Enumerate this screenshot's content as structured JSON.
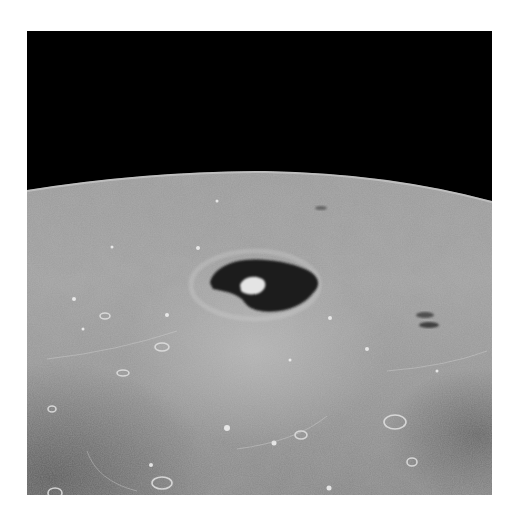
{
  "image": {
    "subject": "Lunar surface photographed from orbit with curved horizon and dark-floored crater",
    "alt": "Far side of the Moon from orbit showing a large crater with a dark mare floor and bright central peak",
    "colors": {
      "page_background": "#ffffff",
      "space": "#000000",
      "surface_light": "#a8a8a8",
      "surface_mid": "#8a8a8a",
      "surface_dark": "#5e5e5e",
      "crater_floor": "#1e1e1e",
      "central_peak": "#e8e8e8"
    },
    "features": [
      {
        "name": "horizon",
        "description": "curved limb against black space"
      },
      {
        "name": "dark-floored-crater",
        "description": "large crater with dark mare floor and bright central peak near image center"
      },
      {
        "name": "small-dark-patches",
        "description": "two small dark streaks right of center"
      },
      {
        "name": "secondary-craters",
        "description": "numerous bright-rimmed small craters in foreground"
      }
    ]
  },
  "caption": {
    "text": ""
  }
}
